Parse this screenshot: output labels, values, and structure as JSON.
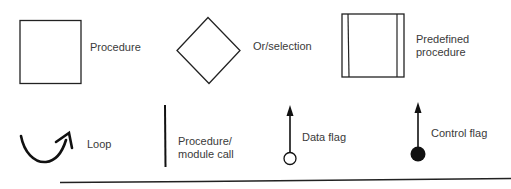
{
  "symbols": [
    {
      "name": "procedure",
      "label": "Procedure"
    },
    {
      "name": "or-selection",
      "label": "Or/selection"
    },
    {
      "name": "predefined-procedure",
      "label_line1": "Predefined",
      "label_line2": "procedure"
    },
    {
      "name": "loop",
      "label": "Loop"
    },
    {
      "name": "procedure-module-call",
      "label_line1": "Procedure/",
      "label_line2": "module call"
    },
    {
      "name": "data-flag",
      "label": "Data flag"
    },
    {
      "name": "control-flag",
      "label": "Control flag"
    }
  ]
}
